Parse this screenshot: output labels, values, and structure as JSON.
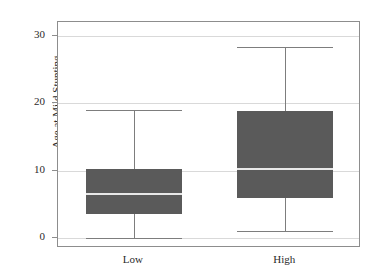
{
  "chart_data": {
    "type": "box",
    "title": "",
    "xlabel": "",
    "ylabel": "Age at Mild Stunting",
    "ylim": [
      0,
      30
    ],
    "yticks": [
      0,
      10,
      20,
      30
    ],
    "ytick_labels": [
      "0",
      "10",
      "20",
      "30"
    ],
    "categories": [
      "Low",
      "High"
    ],
    "grid": true,
    "legend": "none",
    "box_fill_color": "#5a5a5a",
    "median_color": "#e8e8e8",
    "whisker_color": "#7d7d7d",
    "grid_color": "#d9d9d9",
    "frame_color": "#8d8d8d",
    "boxes": [
      {
        "category": "Low",
        "whisker_low": 0.0,
        "q1": 3.6,
        "median": 6.5,
        "q3": 10.2,
        "whisker_high": 19.0
      },
      {
        "category": "High",
        "whisker_low": 1.0,
        "q1": 5.9,
        "median": 10.2,
        "q3": 18.8,
        "whisker_high": 28.4
      }
    ]
  }
}
